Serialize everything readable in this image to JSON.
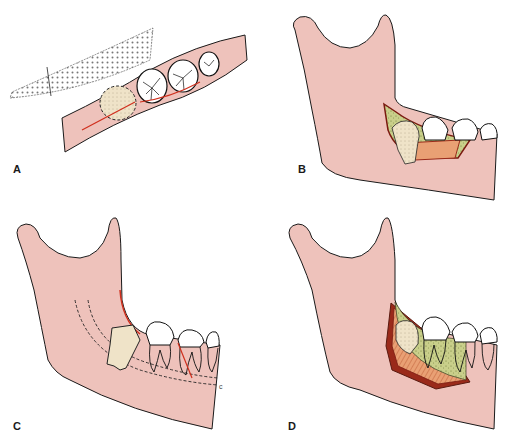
{
  "figure": {
    "panels": [
      {
        "id": "A",
        "label": "A",
        "content": "Occlusal view of posterior mandible with impacted third molar (dashed outline) and incision line"
      },
      {
        "id": "B",
        "label": "B",
        "content": "Lateral mandible with buccal bone window exposing impacted tooth"
      },
      {
        "id": "C",
        "label": "C",
        "content": "Lateral mandible showing impacted molar, inferior alveolar canal (dashed) and incision"
      },
      {
        "id": "D",
        "label": "D",
        "content": "Lateral mandible with full mucoperiosteal flap and bone removal"
      }
    ],
    "canal_marker": "c"
  },
  "colors": {
    "bone": "#eec2bb",
    "outline": "#1a1a1a",
    "incision": "#d0301e",
    "flap": "#9a2a1a",
    "impacted_tooth": "#efe3c8",
    "exposed_bone": "#c9cf8a",
    "cortical_cut": "#e9a074",
    "enamel": "#ffffff"
  }
}
